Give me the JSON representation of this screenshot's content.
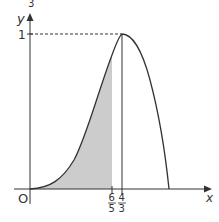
{
  "figure": {
    "page_marker": "3",
    "y_axis_label": "y",
    "x_axis_label": "x",
    "origin_label": "O",
    "y_tick_label": "1",
    "x_ticks": [
      {
        "num": "6",
        "den": "5",
        "value": 1.2
      },
      {
        "num": "4",
        "den": "3",
        "value": 1.3333
      }
    ],
    "shaded_region": {
      "from": 0,
      "to": "6/5",
      "color": "#cccccc"
    },
    "curve_peak": {
      "x": "4/3",
      "y": 1
    },
    "colors": {
      "axes": "#333333",
      "curve": "#333333",
      "shade": "#cccccc"
    }
  }
}
